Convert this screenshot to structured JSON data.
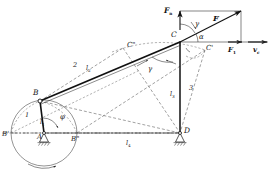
{
  "figure": {
    "type": "kinematic-diagram"
  },
  "joints": {
    "A": "A",
    "B": "B",
    "B_prime": "B'",
    "B_double_prime": "B\"",
    "C": "C",
    "C_prime": "C'",
    "C_double_prime": "C\"",
    "D": "D"
  },
  "links": {
    "link1_number": "1",
    "link1_length": "l",
    "link1_length_sub": "1",
    "link2_number": "2",
    "link2_length": "l",
    "link2_length_sub": "2",
    "link3_number": "3",
    "link3_length": "l",
    "link3_length_sub": "3",
    "link4_length": "l",
    "link4_length_sub": "4"
  },
  "angles": {
    "phi": "φ",
    "alpha": "α",
    "gamma_upper": "γ",
    "gamma_lower": "γ"
  },
  "forces": {
    "F_resultant": "F",
    "F_normal": "F",
    "F_normal_sub": "n",
    "F_tangential": "F",
    "F_tangential_sub": "1",
    "velocity": "v",
    "velocity_sub": "c"
  },
  "colors": {
    "line": "#111111",
    "construction": "#444444",
    "background": "#ffffff"
  }
}
